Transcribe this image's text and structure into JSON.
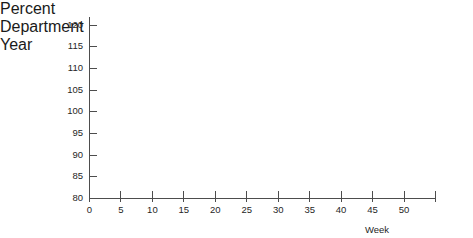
{
  "header": {
    "percent_label": "Percent",
    "department_label": "Department",
    "year_label": "Year"
  },
  "chart_data": {
    "type": "line",
    "title": "",
    "subtitle": "",
    "xlabel": "Week",
    "ylabel": "Percent",
    "xlim": [
      0,
      55
    ],
    "ylim": [
      80,
      122
    ],
    "xticks": [
      0,
      5,
      10,
      15,
      20,
      25,
      30,
      35,
      40,
      45,
      50,
      55
    ],
    "xtick_labels": [
      "0",
      "5",
      "10",
      "15",
      "20",
      "25",
      "30",
      "35",
      "40",
      "45",
      "50",
      ""
    ],
    "yticks": [
      80,
      85,
      90,
      95,
      100,
      105,
      110,
      115,
      120
    ],
    "ytick_labels": [
      "80",
      "85",
      "90",
      "95",
      "100",
      "105",
      "110",
      "115",
      "120"
    ],
    "grid": false,
    "legend": null,
    "series": [],
    "annotations": [],
    "note": "Empty plot frame — no data points are drawn inside the axes."
  },
  "axis": {
    "x_title": "Week",
    "y_title": "Percent"
  },
  "colors": {
    "axis": "#4d4d4d",
    "text": "#262626",
    "background": "#ffffff"
  }
}
